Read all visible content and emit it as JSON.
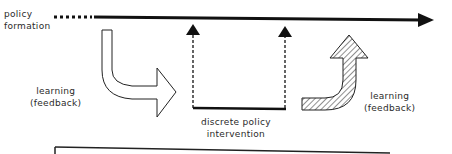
{
  "diagram": {
    "type": "policy process diagram",
    "labels": {
      "policy_formation_line1": "policy",
      "policy_formation_line2": "formation",
      "left_learning_line1": "learning",
      "left_learning_line2": "(feedback)",
      "intervention_line1": "discrete policy",
      "intervention_line2": "intervention",
      "right_learning_line1": "learning",
      "right_learning_line2": "(feedback)"
    },
    "elements": {
      "timeline": "solid arrow pointing right, dotted at start",
      "intervention_arrows": "two dashed vertical arrows pointing up to timeline, joined by solid base line",
      "left_feedback_arrow": "white outlined curved arrow bending down and right",
      "right_feedback_arrow": "hatched curved arrow bending right then up",
      "bottom_bracket": "solid line with left tick"
    },
    "colors": {
      "line": "#111111",
      "text": "#2a2a2a",
      "background": "#ffffff"
    }
  }
}
